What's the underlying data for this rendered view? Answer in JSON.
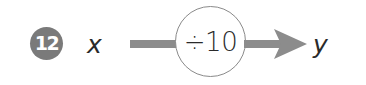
{
  "problem": {
    "number": "12",
    "input_variable": "x",
    "output_variable": "y",
    "operation": {
      "symbol": "÷",
      "operand": "10",
      "label": "÷10"
    }
  },
  "colors": {
    "badge": "#7a7a7a",
    "badge_text": "#ffffff",
    "arrow": "#8c8c8c",
    "circle_stroke": "#8a8a8a",
    "text": "#2a2a2a"
  },
  "icons": {
    "arrow": "right-arrow",
    "operation_container": "circle"
  }
}
